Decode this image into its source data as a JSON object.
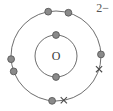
{
  "figure": {
    "kind": "bohr-electron-shell-diagram",
    "nucleus_label": "O",
    "charge_label": "2−",
    "background_color": "#ffffff",
    "shell_stroke_color": "#6e6e6e",
    "electron_dot_fill": "#8a8a8a",
    "electron_dot_stroke": "#5a5a5a",
    "cross_color": "#4a4a4a",
    "nucleus_label_color": "#3a3a3a",
    "charge_label_color": "#555555",
    "center": {
      "x": 56,
      "y": 56
    },
    "shells": [
      {
        "name": "inner-shell",
        "radius": 21,
        "electron_count": 2,
        "electrons": [
          {
            "type": "dot",
            "angle_deg": -90
          },
          {
            "type": "dot",
            "angle_deg": 90
          }
        ]
      },
      {
        "name": "outer-shell",
        "radius": 45,
        "electron_count": 8,
        "electrons": [
          {
            "type": "dot",
            "angle_deg": -100
          },
          {
            "type": "dot",
            "angle_deg": -74
          },
          {
            "type": "dot",
            "angle_deg": 176
          },
          {
            "type": "dot",
            "angle_deg": 160
          },
          {
            "type": "dot",
            "angle_deg": -2
          },
          {
            "type": "cross",
            "angle_deg": 17
          },
          {
            "type": "dot",
            "angle_deg": 95
          },
          {
            "type": "cross",
            "angle_deg": 80
          }
        ]
      }
    ]
  }
}
